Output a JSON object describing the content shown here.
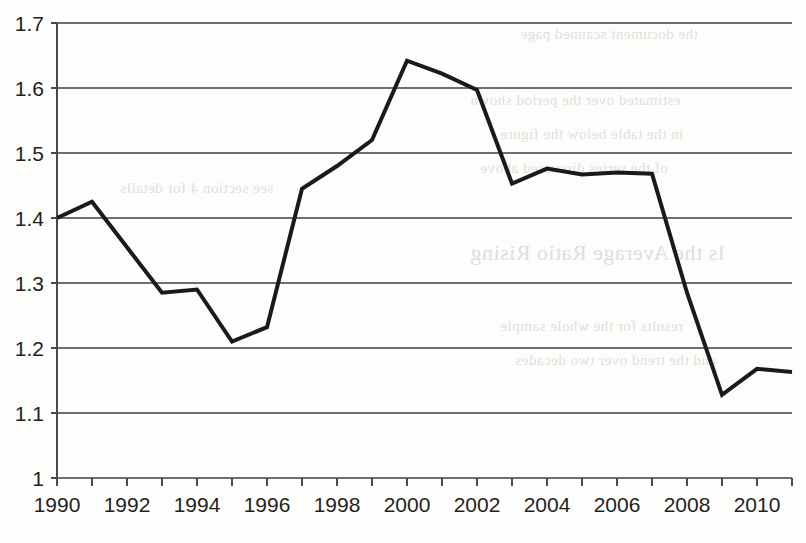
{
  "chart_data": {
    "type": "line",
    "title": "",
    "subtitle": "",
    "xlabel": "",
    "ylabel": "",
    "grid": true,
    "legend": "none",
    "x": [
      1990,
      1991,
      1992,
      1993,
      1994,
      1995,
      1996,
      1997,
      1998,
      1999,
      2000,
      2001,
      2002,
      2003,
      2004,
      2005,
      2006,
      2007,
      2008,
      2009,
      2010,
      2011
    ],
    "values": [
      1.4,
      1.425,
      1.355,
      1.285,
      1.29,
      1.21,
      1.232,
      1.445,
      1.48,
      1.52,
      1.642,
      1.622,
      1.597,
      1.453,
      1.476,
      1.467,
      1.47,
      1.468,
      1.285,
      1.128,
      1.168,
      1.163
    ],
    "series": [
      {
        "name": "series-1",
        "values": [
          1.4,
          1.425,
          1.355,
          1.285,
          1.29,
          1.21,
          1.232,
          1.445,
          1.48,
          1.52,
          1.642,
          1.622,
          1.597,
          1.453,
          1.476,
          1.467,
          1.47,
          1.468,
          1.285,
          1.128,
          1.168,
          1.163
        ],
        "color": "#1a1a1a"
      }
    ],
    "xlim": [
      1990,
      2011
    ],
    "ylim": [
      1.0,
      1.7
    ],
    "ytick_labels": [
      "1.7",
      "1.6",
      "1.5",
      "1.4",
      "1.3",
      "1.2",
      "1.1",
      "1"
    ],
    "ytick_values": [
      1.7,
      1.6,
      1.5,
      1.4,
      1.3,
      1.2,
      1.1,
      1.0
    ],
    "xtick_values": [
      1990,
      1991,
      1992,
      1993,
      1994,
      1995,
      1996,
      1997,
      1998,
      1999,
      2000,
      2001,
      2002,
      2003,
      2004,
      2005,
      2006,
      2007,
      2008,
      2009,
      2010,
      2011
    ],
    "xtick_labels_shown": [
      "1990",
      "1992",
      "1994",
      "1996",
      "1998",
      "2000",
      "2002",
      "2004",
      "2006",
      "2008",
      "2010"
    ],
    "xtick_labeled_values": [
      1990,
      1992,
      1994,
      1996,
      1998,
      2000,
      2002,
      2004,
      2006,
      2008,
      2010
    ]
  },
  "style": {
    "line_color": "#1a1a1a",
    "grid_color": "#6e6e6e",
    "axis_color": "#4a4a4a",
    "text_color": "#231f20",
    "background": "#fdfdfc"
  },
  "background_bleed": [
    "the document scanned page",
    "estimated over the period shown",
    "in the table below the figure",
    "of the series discussed above",
    "Is the Average Ratio Rising",
    "results for the whole sample",
    "and the trend over two decades",
    "see section 4 for details"
  ]
}
